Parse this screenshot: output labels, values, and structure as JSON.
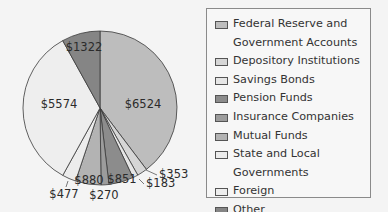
{
  "chart_data": {
    "type": "pie",
    "title": "",
    "start_angle": "12 o'clock, clockwise",
    "categories": [
      "Federal Reserve and Government Accounts",
      "Depository Institutions",
      "Savings Bonds",
      "Pension Funds",
      "Insurance Companies",
      "Mutual Funds",
      "State and Local Governments",
      "Foreign",
      "Other"
    ],
    "values": [
      6524,
      353,
      183,
      851,
      270,
      880,
      477,
      5574,
      1322
    ],
    "value_labels": [
      "$6524",
      "$353",
      "$183",
      "$851",
      "$270",
      "$880",
      "$477",
      "$5574",
      "$1322"
    ],
    "colors": [
      "#bdbdbd",
      "#d6d6d6",
      "#e6e6e6",
      "#8c8c8c",
      "#9c9c9c",
      "#b3b3b3",
      "#ececec",
      "#eeeeee",
      "#858585"
    ],
    "legend_position": "right"
  },
  "legend": {
    "items": [
      {
        "label": "Federal Reserve and\nGovernment Accounts",
        "color": "#bdbdbd"
      },
      {
        "label": "Depository Institutions",
        "color": "#d6d6d6"
      },
      {
        "label": "Savings Bonds",
        "color": "#e6e6e6"
      },
      {
        "label": "Pension Funds",
        "color": "#8c8c8c"
      },
      {
        "label": "Insurance Companies",
        "color": "#9c9c9c"
      },
      {
        "label": "Mutual Funds",
        "color": "#b3b3b3"
      },
      {
        "label": "State and Local Governments",
        "color": "#ececec"
      },
      {
        "label": "Foreign",
        "color": "#eeeeee"
      },
      {
        "label": "Other",
        "color": "#858585"
      }
    ]
  }
}
